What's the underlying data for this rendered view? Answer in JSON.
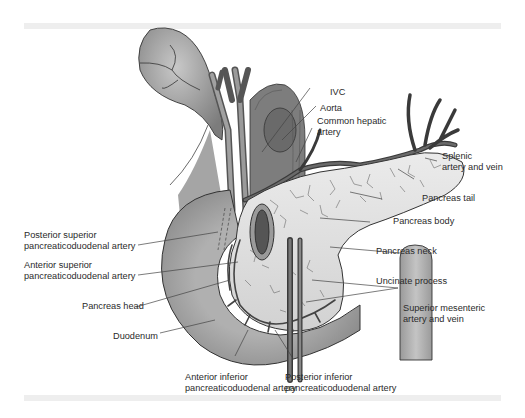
{
  "figure": {
    "palette": {
      "organ_fill": "#bdbdbd",
      "organ_dark": "#7a7a7a",
      "pancreas_fill": "#e2e2e2",
      "vessel": "#5a5a5a",
      "outline": "#333333",
      "leader": "#444444",
      "band": "#eeeeee"
    },
    "labels": {
      "ivc": "IVC",
      "aorta": "Aorta",
      "common_hepatic_artery_1": "Common hepatic",
      "common_hepatic_artery_2": "artery",
      "splenic_1": "Splenic",
      "splenic_2": "artery and vein",
      "pancreas_tail": "Pancreas tail",
      "pancreas_body": "Pancreas body",
      "pancreas_neck": "Pancreas neck",
      "uncinate_process": "Uncinate process",
      "sma_1": "Superior mesenteric",
      "sma_2": "artery and vein",
      "psp_1": "Posterior superior",
      "psp_2": "pancreaticoduodenal artery",
      "asp_1": "Anterior superior",
      "asp_2": "pancreaticoduodenal artery",
      "pancreas_head": "Pancreas head",
      "duodenum": "Duodenum",
      "aip_1": "Anterior inferior",
      "aip_2": "pancreaticoduodenal artery",
      "pip_1": "Posterior inferior",
      "pip_2": "pancreaticoduodenal artery"
    }
  }
}
